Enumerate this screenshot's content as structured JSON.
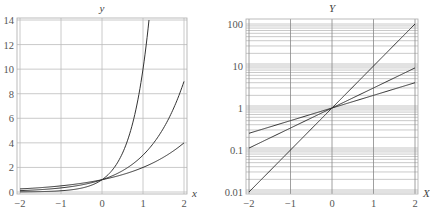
{
  "chart_data": [
    {
      "type": "line",
      "title": "",
      "xlabel": "x",
      "ylabel": "y",
      "xlim": [
        -2,
        2
      ],
      "ylim": [
        0,
        14
      ],
      "yscale": "linear",
      "grid": true,
      "xticks": [
        -2,
        -1,
        0,
        1,
        2
      ],
      "xtick_labels": [
        "−2",
        "−1",
        "0",
        "1",
        "2"
      ],
      "yticks": [
        0,
        2,
        4,
        6,
        8,
        10,
        12,
        14
      ],
      "ytick_labels": [
        "0",
        "2",
        "4",
        "6",
        "8",
        "10",
        "12",
        "14"
      ],
      "series": [
        {
          "name": "y = 2^x",
          "base": 2,
          "x": [
            -2,
            -1,
            0,
            1,
            2
          ],
          "values": [
            0.25,
            0.5,
            1,
            2,
            4
          ]
        },
        {
          "name": "y = 3^x",
          "base": 3,
          "x": [
            -2,
            -1,
            0,
            1,
            2
          ],
          "values": [
            0.111,
            0.333,
            1,
            3,
            9
          ]
        },
        {
          "name": "y = 10^x",
          "base": 10,
          "x": [
            -2,
            -1,
            0,
            1,
            1.146
          ],
          "values": [
            0.01,
            0.1,
            1,
            10,
            14
          ]
        }
      ]
    },
    {
      "type": "line",
      "title": "",
      "xlabel": "X",
      "ylabel": "Y",
      "xlim": [
        -2,
        2
      ],
      "ylim": [
        0.01,
        100
      ],
      "yscale": "log",
      "grid": true,
      "xticks": [
        -2,
        -1,
        0,
        1,
        2
      ],
      "xtick_labels": [
        "−2",
        "−1",
        "0",
        "1",
        "2"
      ],
      "yticks": [
        0.01,
        0.1,
        1,
        10,
        100
      ],
      "ytick_labels": [
        "0.01",
        "0.1",
        "1",
        "10",
        "100"
      ],
      "series": [
        {
          "name": "Y = 2^X",
          "base": 2,
          "x": [
            -2,
            -1,
            0,
            1,
            2
          ],
          "values": [
            0.25,
            0.5,
            1,
            2,
            4
          ]
        },
        {
          "name": "Y = 3^X",
          "base": 3,
          "x": [
            -2,
            -1,
            0,
            1,
            2
          ],
          "values": [
            0.111,
            0.333,
            1,
            3,
            9
          ]
        },
        {
          "name": "Y = 10^X",
          "base": 10,
          "x": [
            -2,
            -1,
            0,
            1,
            2
          ],
          "values": [
            0.01,
            0.1,
            1,
            10,
            100
          ]
        }
      ]
    }
  ]
}
